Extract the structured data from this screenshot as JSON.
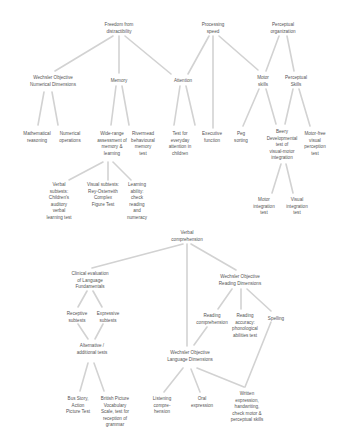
{
  "diagram": {
    "type": "tree",
    "line_color": "#d2d2d2",
    "text_color": "#555555",
    "background": "#ffffff"
  },
  "nodes": {
    "freedom": {
      "label": "Freedom from\ndistractibility",
      "x": 119,
      "y": 22
    },
    "processing": {
      "label": "Processing\nspeed",
      "x": 213,
      "y": 22
    },
    "perceptual_org": {
      "label": "Perceptual\norganization",
      "x": 283,
      "y": 22
    },
    "wond": {
      "label": "Wechsler Objective\nNumerical Dimensions",
      "x": 53,
      "y": 75
    },
    "memory": {
      "label": "Memory",
      "x": 119,
      "y": 78
    },
    "attention": {
      "label": "Attention",
      "x": 183,
      "y": 78
    },
    "motor_skills": {
      "label": "Motor\nskills",
      "x": 263,
      "y": 75
    },
    "perceptual_skills": {
      "label": "Perceptual\nSkills",
      "x": 296,
      "y": 75
    },
    "math_reasoning": {
      "label": "Mathematical\nreasoning",
      "x": 37,
      "y": 131
    },
    "numerical_ops": {
      "label": "Numerical\noperations",
      "x": 70,
      "y": 131
    },
    "wide_range": {
      "label": "Wide-range\nassessment of\nmemory &\nlearning",
      "x": 112,
      "y": 131
    },
    "rivermead": {
      "label": "Rivermead\nbehavioural\nmemory\ntest",
      "x": 143,
      "y": 131
    },
    "everyday_attention": {
      "label": "Test for\neveryday\nattention in\nchildren",
      "x": 180,
      "y": 131
    },
    "executive": {
      "label": "Executive\nfunction",
      "x": 212,
      "y": 131
    },
    "peg": {
      "label": "Peg\nsorting",
      "x": 241,
      "y": 131
    },
    "beery": {
      "label": "Beery\nDevelopmental\ntest of\nvisual-motor\nintegration",
      "x": 282,
      "y": 129
    },
    "motor_free": {
      "label": "Motor-free\nvisual\nperception\ntest",
      "x": 315,
      "y": 131
    },
    "verbal_subtests": {
      "label": "Verbal\nsubtests:\nChildren's\nauditory\nverbal\nlearning test",
      "x": 59,
      "y": 182
    },
    "visual_subtests": {
      "label": "Visual subtests:\nRey-Osterreith\nComplex\nFigure Test",
      "x": 103,
      "y": 182
    },
    "learning_ability": {
      "label": "Learning\nability:\ncheck\nreading\nand\nnumeracy",
      "x": 137,
      "y": 182
    },
    "motor_integration": {
      "label": "Motor\nintegration\ntest",
      "x": 264,
      "y": 197
    },
    "visual_integration": {
      "label": "Visual\nintegration\ntest",
      "x": 297,
      "y": 197
    },
    "verbal_comp": {
      "label": "Verbal\ncomprehension",
      "x": 187,
      "y": 230
    },
    "celf": {
      "label": "Clinical evaluation\nof Language\nFundamentals",
      "x": 90,
      "y": 271
    },
    "word": {
      "label": "Wechsler Objective\nReading Dimensions",
      "x": 240,
      "y": 274
    },
    "receptive": {
      "label": "Receptive\nsubtests",
      "x": 77,
      "y": 311
    },
    "expressive": {
      "label": "Expressive\nsubtests",
      "x": 108,
      "y": 311
    },
    "reading_comp": {
      "label": "Reading\ncomprehension",
      "x": 212,
      "y": 313
    },
    "reading_accuracy": {
      "label": "Reading\naccuracy:\nphonological\nabilities test",
      "x": 245,
      "y": 313
    },
    "spelling": {
      "label": "Spelling",
      "x": 276,
      "y": 316
    },
    "alternative": {
      "label": "Alternative /\nadditional tests",
      "x": 92,
      "y": 343
    },
    "wold": {
      "label": "Wechsler Objective\nLanguage Dimensions",
      "x": 190,
      "y": 350
    },
    "bus_story": {
      "label": "Bus Story,\nAction\nPicture Test",
      "x": 78,
      "y": 396
    },
    "bpvs": {
      "label": "British Picture\nVocabulary\nScale, test for\nreception of\ngrammar",
      "x": 115,
      "y": 396
    },
    "listening": {
      "label": "Listening\ncompre-\nhension",
      "x": 162,
      "y": 396
    },
    "oral": {
      "label": "Oral\nexpression",
      "x": 202,
      "y": 396
    },
    "written": {
      "label": "Written\nexpression,\nhandwriting,\ncheck motor &\nperceptual skills",
      "x": 247,
      "y": 391
    }
  },
  "edges": [
    [
      113,
      36,
      55,
      71
    ],
    [
      119,
      36,
      119,
      73
    ],
    [
      125,
      36,
      171,
      74
    ],
    [
      209,
      36,
      188,
      74
    ],
    [
      213,
      36,
      213,
      128
    ],
    [
      219,
      36,
      258,
      70
    ],
    [
      279,
      36,
      266,
      71
    ],
    [
      287,
      36,
      294,
      71
    ],
    [
      44,
      92,
      38,
      125
    ],
    [
      52,
      92,
      58,
      125
    ],
    [
      116,
      86,
      111,
      125
    ],
    [
      122,
      86,
      129,
      125
    ],
    [
      180,
      86,
      174,
      125
    ],
    [
      186,
      86,
      195,
      125
    ],
    [
      259,
      89,
      243,
      126
    ],
    [
      266,
      89,
      276,
      124
    ],
    [
      293,
      89,
      285,
      124
    ],
    [
      299,
      89,
      310,
      126
    ],
    [
      103,
      162,
      69,
      180
    ],
    [
      108,
      162,
      108,
      180
    ],
    [
      113,
      162,
      131,
      180
    ],
    [
      281,
      164,
      272,
      193
    ],
    [
      286,
      164,
      293,
      193
    ],
    [
      183,
      244,
      92,
      268
    ],
    [
      187,
      244,
      187,
      346
    ],
    [
      191,
      244,
      236,
      270
    ],
    [
      87,
      291,
      78,
      307
    ],
    [
      93,
      291,
      102,
      307
    ],
    [
      78,
      324,
      88,
      339
    ],
    [
      103,
      324,
      95,
      339
    ],
    [
      232,
      289,
      218,
      309
    ],
    [
      241,
      289,
      241,
      309
    ],
    [
      247,
      289,
      271,
      311
    ],
    [
      207,
      327,
      194,
      345
    ],
    [
      271,
      322,
      245,
      387
    ],
    [
      88,
      363,
      80,
      391
    ],
    [
      94,
      363,
      104,
      391
    ],
    [
      183,
      368,
      164,
      392
    ],
    [
      191,
      369,
      200,
      392
    ],
    [
      197,
      368,
      244,
      387
    ]
  ]
}
